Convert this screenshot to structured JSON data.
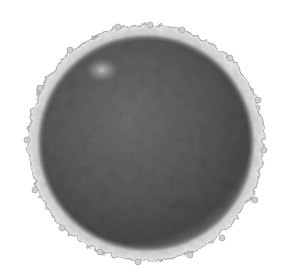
{
  "image": {
    "subject": "spherical cell micrograph",
    "description": "Grayscale micrograph of a round cell with a dark mottled core and a pale, irregular ruffled membrane halo on a white background",
    "background_color": "#ffffff",
    "core_color": "#5a5a5a",
    "core_dark_color": "#444444",
    "halo_color": "#c8c8c8",
    "highlight_color": "#b4b4b4"
  }
}
